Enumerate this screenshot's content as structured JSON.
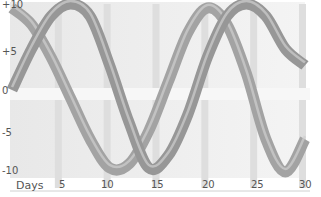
{
  "chart_data": {
    "type": "line",
    "style": "3d-ribbon",
    "title": "",
    "xlabel": "Days",
    "ylabel": "",
    "xlim": [
      0,
      30
    ],
    "ylim": [
      -10,
      10
    ],
    "x_ticks": [
      "5",
      "10",
      "15",
      "20",
      "25",
      "30"
    ],
    "y_ticks": [
      "+10",
      "+5",
      "0",
      "-5",
      "-10"
    ],
    "grid": true,
    "legend": "none",
    "x": [
      0,
      2,
      4,
      6,
      8,
      10,
      12,
      14,
      16,
      18,
      20,
      22,
      24,
      26,
      28,
      30
    ],
    "series": [
      {
        "name": "ribbon-back",
        "values": [
          10,
          8,
          4,
          -1,
          -6,
          -9.5,
          -9,
          -5,
          1,
          7,
          10,
          8,
          2,
          -6,
          -10,
          -6
        ]
      },
      {
        "name": "ribbon-front",
        "values": [
          0,
          5,
          9,
          10.5,
          9,
          3,
          -4,
          -9.5,
          -8,
          -3,
          4,
          9,
          10.5,
          9,
          5,
          3
        ]
      }
    ],
    "colors": {
      "ribbon": "#9a9a9a",
      "ribbon_highlight": "#d8d8d8",
      "wall": "#ececec",
      "grid": "#dedede"
    }
  },
  "axis": {
    "x_label": "Days",
    "x_ticks": [
      "5",
      "10",
      "15",
      "20",
      "25",
      "30"
    ],
    "y_ticks": [
      "+10",
      "+5",
      "0",
      "-5",
      "-10"
    ]
  }
}
